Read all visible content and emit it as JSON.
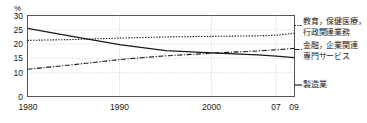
{
  "chart_data": {
    "type": "line",
    "title": "",
    "xlabel": "",
    "ylabel": "%",
    "ylim": [
      0,
      30
    ],
    "yticks": [
      30,
      25,
      20,
      15,
      10,
      0
    ],
    "broken_axis": true,
    "broken_axis_note": "axis compressed between 10 and 0",
    "grid": true,
    "gridlines_x": [
      1990,
      2000,
      2007
    ],
    "xticks": [
      1980,
      1990,
      2000,
      2007,
      2009
    ],
    "xtick_labels": [
      "1980",
      "1990",
      "2000",
      "07",
      "09"
    ],
    "xlim": [
      1980,
      2009
    ],
    "legend_position": "right",
    "series": [
      {
        "name": "教育，保健医療，行政関連業務",
        "label_line1": "教育，保健医療，",
        "label_line2": "行政関連業務",
        "style": "dotted",
        "color": "#1a1a1a",
        "x": [
          1980,
          1985,
          1990,
          1995,
          2000,
          2005,
          2007,
          2009
        ],
        "values": [
          21.3,
          21.6,
          22.1,
          22.5,
          22.7,
          22.9,
          23.1,
          23.8
        ]
      },
      {
        "name": "金融，企業関連専門サービス",
        "label_line1": "金融，企業関連",
        "label_line2": "専門サービス",
        "style": "dash-dot",
        "color": "#1a1a1a",
        "x": [
          1980,
          1985,
          1990,
          1995,
          2000,
          2005,
          2007,
          2009
        ],
        "values": [
          11.2,
          12.8,
          14.6,
          15.9,
          16.8,
          17.6,
          18.0,
          18.5
        ]
      },
      {
        "name": "製造業",
        "label_line1": "製造業",
        "label_line2": "",
        "style": "solid",
        "color": "#1a1a1a",
        "x": [
          1980,
          1985,
          1990,
          1995,
          2000,
          2005,
          2007,
          2009
        ],
        "values": [
          25.5,
          22.6,
          19.8,
          17.7,
          16.9,
          16.2,
          15.8,
          15.3
        ]
      }
    ]
  },
  "axis": {
    "y_unit": "%",
    "yticks": [
      "30",
      "25",
      "20",
      "15",
      "10",
      "0"
    ],
    "xticks": [
      "1980",
      "1990",
      "2000",
      "07",
      "09"
    ]
  },
  "legend": [
    {
      "line1": "教育，保健医療，",
      "line2": "行政関連業務"
    },
    {
      "line1": "金融，企業関連",
      "line2": "専門サービス"
    },
    {
      "line1": "製造業",
      "line2": ""
    }
  ]
}
